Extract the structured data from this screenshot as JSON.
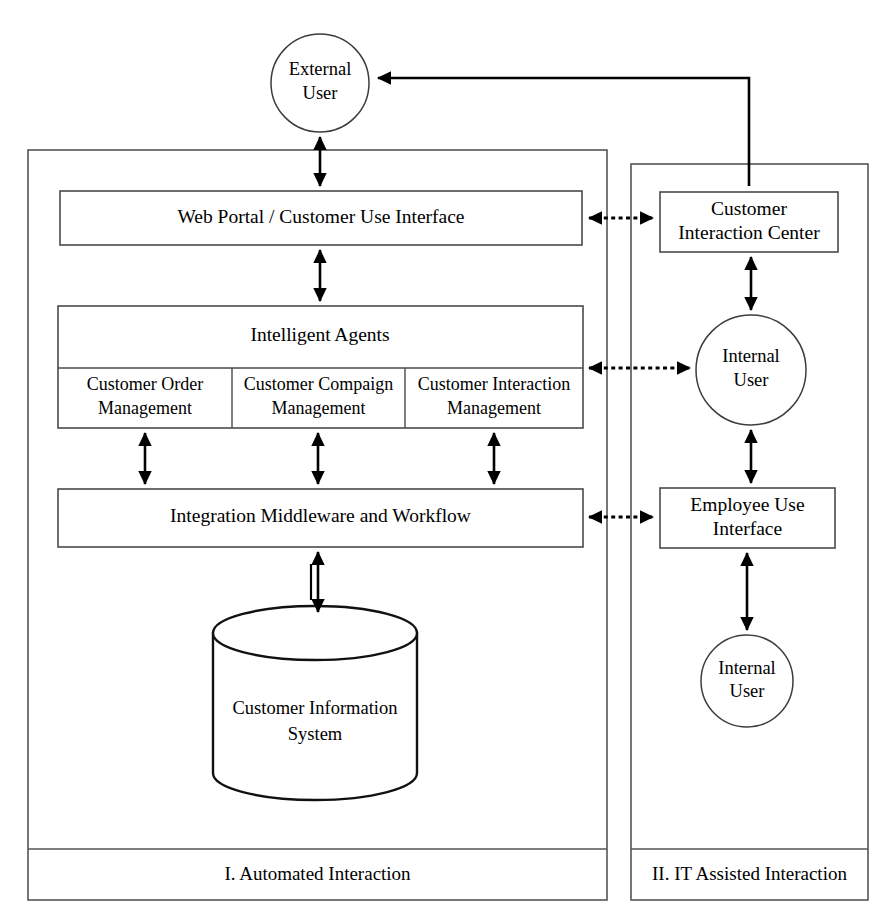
{
  "diagram": {
    "panels": [
      {
        "id": "automated",
        "footer_label": "I. Automated Interaction"
      },
      {
        "id": "it_assisted",
        "footer_label": "II. IT Assisted Interaction"
      }
    ],
    "actors": {
      "external_user": "External\nUser",
      "external_user_line1": "External",
      "external_user_line2": "User",
      "internal_user_upper_line1": "Internal",
      "internal_user_upper_line2": "User",
      "internal_user_lower_line1": "Internal",
      "internal_user_lower_line2": "User"
    },
    "nodes": {
      "web_portal": "Web Portal  / Customer Use Interface",
      "intelligent_agents": "Intelligent Agents",
      "agent_order_line1": "Customer Order",
      "agent_order_line2": "Management",
      "agent_campaign_line1": "Customer Compaign",
      "agent_campaign_line2": "Management",
      "agent_interaction_line1": "Customer Interaction",
      "agent_interaction_line2": "Management",
      "integration_middleware": "Integration Middleware and Workflow",
      "customer_information_system_line1": "Customer Information",
      "customer_information_system_line2": "System",
      "customer_interaction_center_line1": "Customer",
      "customer_interaction_center_line2": "Interaction Center",
      "employee_use_interface_line1": "Employee Use",
      "employee_use_interface_line2": "Interface"
    },
    "colors": {
      "background": "#ffffff",
      "stroke": "#000000",
      "panel_stroke": "#555555",
      "node_stroke": "#4a4a4a"
    }
  }
}
